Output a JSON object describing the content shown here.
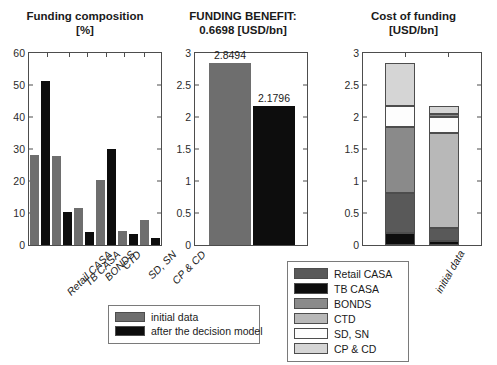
{
  "figure": {
    "background": "#ffffff",
    "width": 497,
    "height": 365
  },
  "panels": {
    "composition": {
      "title": "Funding composition\n[%]"
    },
    "benefit": {
      "title": "FUNDING BENEFIT:\n0.6698 [USD/bn]"
    },
    "cost": {
      "title": "Cost of funding\n[USD/bn]"
    }
  },
  "series_legend": {
    "items": [
      {
        "label": "initial data",
        "color": "#6e6e6e"
      },
      {
        "label": "after the decision model",
        "color": "#0d0d0d"
      }
    ]
  },
  "stack_legend": {
    "items": [
      {
        "label": "Retail CASA",
        "color": "#595959"
      },
      {
        "label": "TB CASA",
        "color": "#0d0d0d"
      },
      {
        "label": "BONDS",
        "color": "#8a8a8a"
      },
      {
        "label": "CTD",
        "color": "#b8b8b8"
      },
      {
        "label": "SD, SN",
        "color": "#fdfdfd"
      },
      {
        "label": "CP & CD",
        "color": "#d5d5d5"
      }
    ]
  },
  "chart_data": [
    {
      "id": "funding-composition",
      "type": "bar",
      "title": "Funding composition [%]",
      "xlabel": "",
      "ylabel": "[%]",
      "ylim": [
        0,
        60
      ],
      "yticks": [
        0,
        10,
        20,
        30,
        40,
        50,
        60
      ],
      "grid": false,
      "legend_position": "below-center",
      "categories": [
        "Retail CASA",
        "TB CASA",
        "BONDS",
        "CTD",
        "SD, SN",
        "CP & CD"
      ],
      "series": [
        {
          "name": "initial data",
          "color": "#6e6e6e",
          "values": [
            28.1,
            27.9,
            11.5,
            20.4,
            4.3,
            7.9
          ]
        },
        {
          "name": "after the decision model",
          "color": "#0d0d0d",
          "values": [
            51.1,
            10.3,
            4.1,
            30.1,
            3.4,
            2.2
          ]
        }
      ]
    },
    {
      "id": "funding-benefit",
      "type": "bar",
      "title": "FUNDING BENEFIT: 0.6698 [USD/bn]",
      "xlabel": "",
      "ylabel": "[USD/bn]",
      "ylim": [
        0,
        3
      ],
      "yticks": [
        0,
        0.5,
        1,
        1.5,
        2,
        2.5,
        3
      ],
      "grid": false,
      "legend_position": "none",
      "categories": [
        "initial data",
        "after the decision model"
      ],
      "values": [
        2.8494,
        2.1796
      ],
      "data_labels": [
        "2.8494",
        "2.1796"
      ],
      "colors": [
        "#6e6e6e",
        "#0d0d0d"
      ],
      "annotation": "FUNDING BENEFIT: 0.6698 [USD/bn]"
    },
    {
      "id": "cost-of-funding",
      "type": "bar",
      "stacked": true,
      "title": "Cost of funding [USD/bn]",
      "xlabel": "",
      "ylabel": "[USD/bn]",
      "ylim": [
        0,
        3
      ],
      "yticks": [
        0,
        0.5,
        1,
        1.5,
        2,
        2.5,
        3
      ],
      "grid": false,
      "legend_position": "left-of-axes",
      "categories": [
        "initial data",
        "after the decision model"
      ],
      "series": [
        {
          "name": "TB CASA",
          "color": "#0d0d0d",
          "values": [
            0.19,
            0.07
          ]
        },
        {
          "name": "Retail CASA",
          "color": "#595959",
          "values": [
            0.63,
            0.2
          ]
        },
        {
          "name": "BONDS",
          "color": "#8a8a8a",
          "values": [
            1.03,
            0.0
          ]
        },
        {
          "name": "CTD",
          "color": "#b8b8b8",
          "values": [
            0.0,
            1.48
          ]
        },
        {
          "name": "SD, SN",
          "color": "#fdfdfd",
          "values": [
            0.32,
            0.25
          ]
        },
        {
          "name": "BONDS-thin",
          "color": "#8a8a8a",
          "values": [
            0.0,
            0.04
          ]
        },
        {
          "name": "CP & CD",
          "color": "#d5d5d5",
          "values": [
            0.68,
            0.14
          ]
        }
      ],
      "totals": [
        2.85,
        2.18
      ]
    }
  ]
}
